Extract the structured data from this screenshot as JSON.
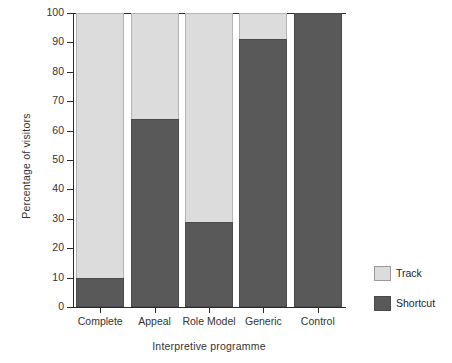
{
  "chart_data": {
    "type": "bar",
    "stacked": true,
    "stack_total": 100,
    "title": "",
    "xlabel": "Interpretive programme",
    "ylabel": "Percentage of visitors",
    "categories": [
      "Complete",
      "Appeal",
      "Role Model",
      "Generic",
      "Control"
    ],
    "series": [
      {
        "name": "Track",
        "color": "#dcdcdc",
        "values": [
          90,
          36,
          71,
          9,
          0
        ]
      },
      {
        "name": "Shortcut",
        "color": "#595959",
        "values": [
          10,
          64,
          29,
          91,
          100
        ]
      }
    ],
    "ylim": [
      0,
      100
    ],
    "yticks": [
      0,
      10,
      20,
      30,
      40,
      50,
      60,
      70,
      80,
      90,
      100
    ],
    "ytick_labels": [
      "0",
      "10",
      "20",
      "30",
      "40",
      "50",
      "60",
      "70",
      "80",
      "90",
      "100"
    ],
    "grid": false,
    "legend_position": "right"
  },
  "legend": {
    "entries": [
      {
        "label": "Track",
        "color": "#dcdcdc"
      },
      {
        "label": "Shortcut",
        "color": "#595959"
      }
    ]
  },
  "colors": {
    "track": "#dcdcdc",
    "shortcut": "#595959",
    "axis": "#2b2b2b",
    "text": "#333333",
    "background": "#ffffff"
  }
}
